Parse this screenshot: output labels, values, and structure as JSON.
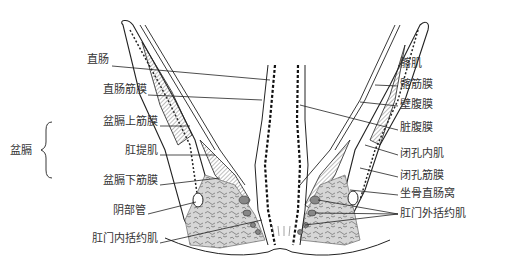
{
  "figure": {
    "left_labels": [
      {
        "id": "rectum",
        "text": "直肠",
        "x": 110,
        "y": 60
      },
      {
        "id": "rectal-fascia",
        "text": "直肠筋膜",
        "x": 110,
        "y": 90
      },
      {
        "id": "superior-fascia-pelvic-diaphragm",
        "text": "盆膈上筋膜",
        "x": 110,
        "y": 121
      },
      {
        "id": "levator-ani",
        "text": "肛提肌",
        "x": 110,
        "y": 150
      },
      {
        "id": "inferior-fascia-pelvic-diaphragm",
        "text": "盆膈下筋膜",
        "x": 110,
        "y": 180
      },
      {
        "id": "pudendal-canal",
        "text": "阴部管",
        "x": 110,
        "y": 210
      },
      {
        "id": "internal-anal-sphincter",
        "text": "肛门内括约肌",
        "x": 110,
        "y": 238
      }
    ],
    "group_label": {
      "text": "盆膈",
      "x": 10,
      "y": 150
    },
    "right_labels": [
      {
        "id": "iliacus",
        "text": "髂肌",
        "x": 400,
        "y": 60
      },
      {
        "id": "iliac-fascia",
        "text": "髂筋膜",
        "x": 400,
        "y": 80
      },
      {
        "id": "parietal-peritoneum",
        "text": "壁腹膜",
        "x": 400,
        "y": 100
      },
      {
        "id": "visceral-peritoneum",
        "text": "脏腹膜",
        "x": 400,
        "y": 125
      },
      {
        "id": "obturator-internus",
        "text": "闭孔内肌",
        "x": 400,
        "y": 150
      },
      {
        "id": "obturator-fascia",
        "text": "闭孔筋膜",
        "x": 400,
        "y": 172
      },
      {
        "id": "ischioanal-fossa",
        "text": "坐骨直肠窝",
        "x": 400,
        "y": 190
      },
      {
        "id": "external-anal-sphincter",
        "text": "肛门外括约肌",
        "x": 400,
        "y": 210
      }
    ]
  }
}
